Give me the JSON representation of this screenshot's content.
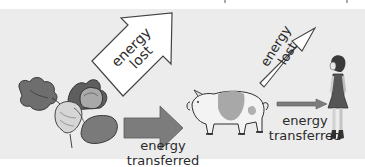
{
  "diagram": {
    "nodes": [
      {
        "id": "plants",
        "label": "vegetables",
        "icon": "vegetables-illustration"
      },
      {
        "id": "pig",
        "label": "pig",
        "icon": "pig-illustration"
      },
      {
        "id": "girl",
        "label": "girl",
        "icon": "girl-illustration"
      }
    ],
    "edges": [
      {
        "from": "plants",
        "to": "pig",
        "label": "energy transferred"
      },
      {
        "from": "pig",
        "to": "girl",
        "label": "energy transferred"
      }
    ],
    "losses": [
      {
        "from": "plants",
        "label": "energy lost",
        "size": "large"
      },
      {
        "from": "pig",
        "label": "energy lost",
        "size": "small"
      }
    ]
  },
  "labels": {
    "lost_big_line1": "energy",
    "lost_big_line2": "lost",
    "lost_small_line1": "energy",
    "lost_small_line2": "lost",
    "transfer1_line1": "energy",
    "transfer1_line2": "transferred",
    "transfer2_line1": "energy",
    "transfer2_line2": "transferred"
  },
  "colors": {
    "background": "#ececec",
    "arrow_fill_transfer": "#7a7a7a",
    "arrow_fill_lost": "#ffffff",
    "outline": "#3a3a3a",
    "text": "#2b2b2b"
  }
}
